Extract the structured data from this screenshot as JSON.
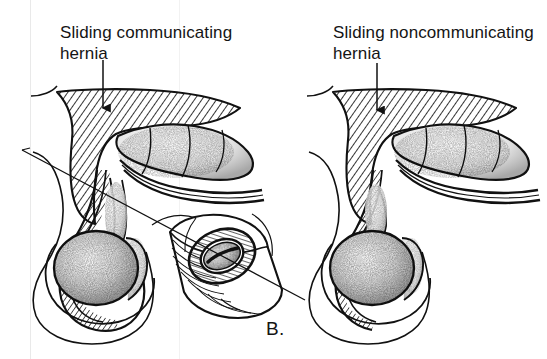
{
  "figure": {
    "caption": "B.",
    "background_color": "#ffffff",
    "ink_color": "#111111",
    "medium": "black-and-white line drawing"
  },
  "labels": {
    "left": {
      "line1": "Sliding communicating",
      "line2": "hernia",
      "full_text": "Sliding communicating hernia"
    },
    "right": {
      "line1": "Sliding noncommunicating",
      "line2": "hernia",
      "full_text": "Sliding noncommunicating hernia"
    }
  },
  "annotations": {
    "left_leader": "arrow-down-to-abdominal-wall",
    "right_leader": "arrow-down-to-abdominal-wall",
    "inset_leader": "diagonal-line-to-cord-cross-section"
  },
  "panels": [
    {
      "name": "left-panel",
      "label_key": "left",
      "description": "Sliding communicating hernia: peritoneal sac continuous with tunica vaginalis surrounding the testis"
    },
    {
      "name": "right-panel",
      "label_key": "right",
      "description": "Sliding noncommunicating hernia: sac terminates above the testis"
    },
    {
      "name": "center-inset",
      "label_key": null,
      "description": "Cylindrical cross-section of spermatic cord showing hatched hernia sac ring and stippled contents"
    }
  ],
  "colors": {
    "ink": "#111111",
    "paper": "#ffffff",
    "scan_artifact": "#e9e9e9"
  }
}
